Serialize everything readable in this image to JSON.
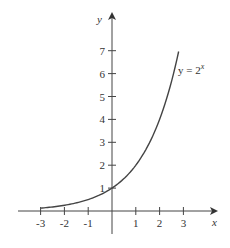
{
  "chart_data": {
    "type": "line",
    "title": "",
    "xlabel": "x",
    "ylabel": "y",
    "xlim": [
      -3.5,
      4.3
    ],
    "ylim": [
      -1,
      8.5
    ],
    "grid": false,
    "legend": "none",
    "x_ticks": [
      -3,
      -2,
      -1,
      1,
      2,
      3
    ],
    "x_tick_labels": [
      "-3",
      "-2",
      "-1",
      "1",
      "2",
      "3"
    ],
    "y_ticks": [
      1,
      2,
      3,
      4,
      5,
      6,
      7
    ],
    "y_tick_labels": [
      "1",
      "2",
      "3",
      "4",
      "5",
      "6",
      "7"
    ],
    "series": [
      {
        "name": "y = 2^x",
        "function": "2^x",
        "x": [
          -3,
          -2.5,
          -2,
          -1.5,
          -1,
          -0.5,
          0,
          0.5,
          1,
          1.5,
          2,
          2.5,
          2.8
        ],
        "values": [
          0.125,
          0.177,
          0.25,
          0.354,
          0.5,
          0.707,
          1,
          1.414,
          2,
          2.828,
          4,
          5.657,
          6.964
        ]
      }
    ],
    "annotations": [
      {
        "text": "y = 2",
        "superscript": "x",
        "near": [
          2.9,
          6.1
        ]
      }
    ],
    "color": "#444444"
  }
}
